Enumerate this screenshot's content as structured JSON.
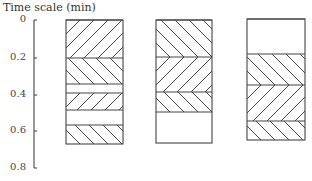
{
  "axis": {
    "title": "Time scale (min)",
    "ticks": [
      {
        "label": "0",
        "value": 0,
        "y": 20
      },
      {
        "label": "0.2",
        "value": 0.2,
        "y": 58
      },
      {
        "label": "0.4",
        "value": 0.4,
        "y": 95
      },
      {
        "label": "0.6",
        "value": 0.6,
        "y": 131
      },
      {
        "label": "0.8",
        "value": 0.8,
        "y": 168
      }
    ]
  },
  "columns": [
    {
      "name": "column-1",
      "x": 66,
      "width": 57,
      "bands": [
        {
          "from": 20,
          "to": 58,
          "pattern": "forward"
        },
        {
          "from": 58,
          "to": 84,
          "pattern": "back"
        },
        {
          "from": 84,
          "to": 93,
          "pattern": "none"
        },
        {
          "from": 93,
          "to": 110,
          "pattern": "forward"
        },
        {
          "from": 110,
          "to": 125,
          "pattern": "none"
        },
        {
          "from": 125,
          "to": 144,
          "pattern": "back"
        }
      ]
    },
    {
      "name": "column-2",
      "x": 156,
      "width": 56,
      "bands": [
        {
          "from": 20,
          "to": 57,
          "pattern": "back"
        },
        {
          "from": 57,
          "to": 92,
          "pattern": "forward"
        },
        {
          "from": 92,
          "to": 112,
          "pattern": "back"
        },
        {
          "from": 112,
          "to": 143,
          "pattern": "none"
        }
      ]
    },
    {
      "name": "column-3",
      "x": 247,
      "width": 58,
      "bands": [
        {
          "from": 19,
          "to": 54,
          "pattern": "none"
        },
        {
          "from": 54,
          "to": 85,
          "pattern": "back"
        },
        {
          "from": 85,
          "to": 121,
          "pattern": "forward"
        },
        {
          "from": 121,
          "to": 140,
          "pattern": "back"
        }
      ]
    }
  ],
  "colors": {
    "stroke": "#444444",
    "axis": "#555555"
  }
}
